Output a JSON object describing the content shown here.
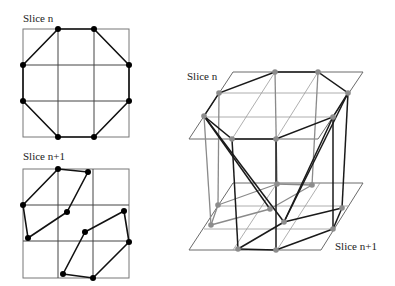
{
  "labels": {
    "left_top": "Slice n",
    "left_bottom": "Slice n+1",
    "right_top": "Slice n",
    "right_bottom": "Slice n+1"
  },
  "left_top_grid": {
    "rect": [
      23,
      29,
      129,
      137
    ],
    "vlines": [
      58,
      94
    ],
    "hlines": [
      65,
      101
    ],
    "octagon": [
      [
        58,
        29
      ],
      [
        94,
        29
      ],
      [
        129,
        65
      ],
      [
        129,
        101
      ],
      [
        94,
        137
      ],
      [
        58,
        137
      ],
      [
        23,
        101
      ],
      [
        23,
        65
      ]
    ]
  },
  "left_bottom_grid": {
    "rect": [
      23,
      169,
      129,
      278
    ],
    "vlines": [
      58,
      93
    ],
    "hlines": [
      205,
      241
    ],
    "polygons": [
      [
        [
          58,
          169
        ],
        [
          88,
          172
        ],
        [
          67,
          212
        ],
        [
          28,
          238
        ],
        [
          23,
          205
        ]
      ],
      [
        [
          85,
          232
        ],
        [
          124,
          211
        ],
        [
          129,
          242
        ],
        [
          93,
          278
        ],
        [
          63,
          274
        ]
      ]
    ]
  },
  "right_3d": {
    "top_plane": [
      [
        233,
        72
      ],
      [
        363,
        72
      ],
      [
        318,
        139
      ],
      [
        189,
        139
      ]
    ],
    "top_hlines": [
      [
        [
          219,
          93
        ],
        [
          349,
          93
        ]
      ],
      [
        [
          204,
          117
        ],
        [
          334,
          117
        ]
      ]
    ],
    "top_diag": [
      [
        [
          275,
          72
        ],
        [
          232,
          139
        ]
      ],
      [
        [
          318,
          72
        ],
        [
          276,
          139
        ]
      ]
    ],
    "top_octagon": [
      [
        275,
        72
      ],
      [
        318,
        72
      ],
      [
        348,
        93
      ],
      [
        333,
        117
      ],
      [
        276,
        139
      ],
      [
        232,
        139
      ],
      [
        204,
        116
      ],
      [
        219,
        93
      ]
    ],
    "bottom_plane": [
      [
        233,
        183
      ],
      [
        363,
        183
      ],
      [
        321,
        250
      ],
      [
        189,
        250
      ]
    ],
    "bottom_hlines": [
      [
        [
          219,
          206
        ],
        [
          349,
          206
        ]
      ],
      [
        [
          204,
          229
        ],
        [
          334,
          229
        ]
      ]
    ],
    "bottom_diag": [
      [
        [
          277,
          183
        ],
        [
          233,
          250
        ]
      ],
      [
        [
          320,
          183
        ],
        [
          277,
          250
        ]
      ]
    ],
    "bottom_dots": [
      [
        277,
        184
      ],
      [
        312,
        185
      ],
      [
        218,
        205
      ],
      [
        270,
        209
      ],
      [
        211,
        225
      ],
      [
        284,
        222
      ],
      [
        342,
        208
      ],
      [
        333,
        229
      ],
      [
        238,
        249
      ],
      [
        276,
        250
      ]
    ],
    "gray_edges": [
      [
        [
          219,
          93
        ],
        [
          218,
          205
        ]
      ],
      [
        [
          204,
          116
        ],
        [
          211,
          225
        ]
      ],
      [
        [
          275,
          72
        ],
        [
          277,
          184
        ]
      ],
      [
        [
          318,
          72
        ],
        [
          312,
          185
        ]
      ],
      [
        [
          218,
          205
        ],
        [
          277,
          184
        ]
      ],
      [
        [
          277,
          184
        ],
        [
          312,
          185
        ]
      ],
      [
        [
          211,
          225
        ],
        [
          270,
          209
        ]
      ],
      [
        [
          270,
          209
        ],
        [
          312,
          185
        ]
      ],
      [
        [
          218,
          205
        ],
        [
          211,
          225
        ]
      ]
    ],
    "dark_edges": [
      [
        [
          232,
          139
        ],
        [
          238,
          249
        ]
      ],
      [
        [
          276,
          139
        ],
        [
          276,
          250
        ]
      ],
      [
        [
          348,
          93
        ],
        [
          342,
          208
        ]
      ],
      [
        [
          333,
          117
        ],
        [
          333,
          229
        ]
      ],
      [
        [
          204,
          116
        ],
        [
          270,
          209
        ]
      ],
      [
        [
          204,
          116
        ],
        [
          284,
          222
        ]
      ],
      [
        [
          348,
          93
        ],
        [
          284,
          222
        ]
      ],
      [
        [
          333,
          117
        ],
        [
          284,
          222
        ]
      ],
      [
        [
          238,
          249
        ],
        [
          284,
          222
        ]
      ],
      [
        [
          238,
          249
        ],
        [
          276,
          250
        ]
      ],
      [
        [
          276,
          250
        ],
        [
          333,
          229
        ]
      ],
      [
        [
          333,
          229
        ],
        [
          342,
          208
        ]
      ],
      [
        [
          284,
          222
        ],
        [
          342,
          208
        ]
      ]
    ]
  }
}
